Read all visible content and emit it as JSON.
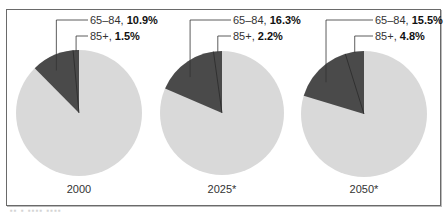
{
  "chart_data": [
    {
      "type": "pie",
      "title": "2000",
      "slices": [
        {
          "label": "65–84",
          "value": 10.9,
          "color": "#4a4a4a"
        },
        {
          "label": "85+",
          "value": 1.5,
          "color": "#4a4a4a"
        },
        {
          "label": "Under 65",
          "value": 87.6,
          "color": "#d9d9d9"
        }
      ]
    },
    {
      "type": "pie",
      "title": "2025*",
      "slices": [
        {
          "label": "65–84",
          "value": 16.3,
          "color": "#4a4a4a"
        },
        {
          "label": "85+",
          "value": 2.2,
          "color": "#4a4a4a"
        },
        {
          "label": "Under 65",
          "value": 81.5,
          "color": "#d9d9d9"
        }
      ]
    },
    {
      "type": "pie",
      "title": "2050*",
      "slices": [
        {
          "label": "65–84",
          "value": 15.5,
          "color": "#4a4a4a"
        },
        {
          "label": "85+",
          "value": 4.8,
          "color": "#4a4a4a"
        },
        {
          "label": "Under 65",
          "value": 79.7,
          "color": "#d9d9d9"
        }
      ]
    }
  ],
  "pies": [
    {
      "year": "2000",
      "a_label": "65–84, ",
      "a_value": "10.9%",
      "b_label": "85+, ",
      "b_value": "1.5%"
    },
    {
      "year": "2025*",
      "a_label": "65–84, ",
      "a_value": "16.3%",
      "b_label": "85+, ",
      "b_value": "2.2%"
    },
    {
      "year": "2050*",
      "a_label": "65–84, ",
      "a_value": "15.5%",
      "b_label": "85+, ",
      "b_value": "4.8%"
    }
  ],
  "colors": {
    "dark": "#4a4a4a",
    "light": "#d9d9d9",
    "border": "#6a6a6a"
  }
}
